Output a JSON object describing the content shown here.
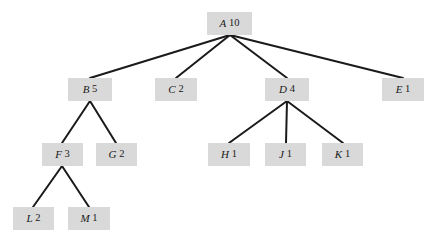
{
  "diagram": {
    "type": "tree",
    "background_color": "#ffffff",
    "node_fill_color": "#d9d9d9",
    "edge_color": "#1a1a1a",
    "text_color": "#1a1a1a",
    "width": 430,
    "height": 244,
    "levels": 4
  },
  "nodes": [
    {
      "id": "A",
      "label": "A",
      "value": "10",
      "x": 207,
      "y": 12,
      "w": 45,
      "h": 23,
      "level": 0
    },
    {
      "id": "B",
      "label": "B",
      "value": "5",
      "x": 68,
      "y": 78,
      "w": 44,
      "h": 23,
      "level": 1
    },
    {
      "id": "C",
      "label": "C",
      "value": "2",
      "x": 155,
      "y": 78,
      "w": 42,
      "h": 23,
      "level": 1
    },
    {
      "id": "D",
      "label": "D",
      "value": "4",
      "x": 265,
      "y": 78,
      "w": 44,
      "h": 23,
      "level": 1
    },
    {
      "id": "E",
      "label": "E",
      "value": "1",
      "x": 382,
      "y": 78,
      "w": 42,
      "h": 23,
      "level": 1
    },
    {
      "id": "F",
      "label": "F",
      "value": "3",
      "x": 42,
      "y": 143,
      "w": 41,
      "h": 23,
      "level": 2
    },
    {
      "id": "G",
      "label": "G",
      "value": "2",
      "x": 96,
      "y": 143,
      "w": 41,
      "h": 23,
      "level": 2
    },
    {
      "id": "H",
      "label": "H",
      "value": "1",
      "x": 208,
      "y": 143,
      "w": 42,
      "h": 23,
      "level": 2
    },
    {
      "id": "J",
      "label": "J",
      "value": "1",
      "x": 265,
      "y": 143,
      "w": 41,
      "h": 23,
      "level": 2
    },
    {
      "id": "K",
      "label": "K",
      "value": "1",
      "x": 322,
      "y": 143,
      "w": 41,
      "h": 23,
      "level": 2
    },
    {
      "id": "L",
      "label": "L",
      "value": "2",
      "x": 13,
      "y": 207,
      "w": 41,
      "h": 23,
      "level": 3
    },
    {
      "id": "M",
      "label": "M",
      "value": "1",
      "x": 68,
      "y": 207,
      "w": 42,
      "h": 23,
      "level": 3
    }
  ],
  "edges": [
    {
      "from": "A",
      "to": "B",
      "x1": 230,
      "y1": 35,
      "x2": 90,
      "y2": 78
    },
    {
      "from": "A",
      "to": "C",
      "x1": 230,
      "y1": 35,
      "x2": 176,
      "y2": 78
    },
    {
      "from": "A",
      "to": "D",
      "x1": 230,
      "y1": 35,
      "x2": 287,
      "y2": 78
    },
    {
      "from": "A",
      "to": "E",
      "x1": 230,
      "y1": 35,
      "x2": 403,
      "y2": 78
    },
    {
      "from": "B",
      "to": "F",
      "x1": 90,
      "y1": 101,
      "x2": 62,
      "y2": 143
    },
    {
      "from": "B",
      "to": "G",
      "x1": 90,
      "y1": 101,
      "x2": 116,
      "y2": 143
    },
    {
      "from": "D",
      "to": "H",
      "x1": 287,
      "y1": 101,
      "x2": 229,
      "y2": 143
    },
    {
      "from": "D",
      "to": "J",
      "x1": 287,
      "y1": 101,
      "x2": 286,
      "y2": 143
    },
    {
      "from": "D",
      "to": "K",
      "x1": 287,
      "y1": 101,
      "x2": 343,
      "y2": 143
    },
    {
      "from": "F",
      "to": "L",
      "x1": 62,
      "y1": 166,
      "x2": 33,
      "y2": 207
    },
    {
      "from": "F",
      "to": "M",
      "x1": 62,
      "y1": 166,
      "x2": 89,
      "y2": 207
    }
  ],
  "chart_data": {
    "type": "tree",
    "node_values": {
      "A": 10,
      "B": 5,
      "C": 2,
      "D": 4,
      "E": 1,
      "F": 3,
      "G": 2,
      "H": 1,
      "J": 1,
      "K": 1,
      "L": 2,
      "M": 1
    },
    "adjacency": {
      "A": [
        "B",
        "C",
        "D",
        "E"
      ],
      "B": [
        "F",
        "G"
      ],
      "C": [],
      "D": [
        "H",
        "J",
        "K"
      ],
      "E": [],
      "F": [
        "L",
        "M"
      ],
      "G": [],
      "H": [],
      "J": [],
      "K": [],
      "L": [],
      "M": []
    },
    "root": "A",
    "depth": 4
  }
}
